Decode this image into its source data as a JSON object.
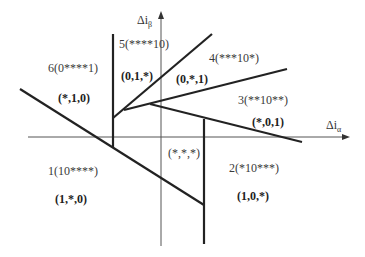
{
  "diagram": {
    "colors": {
      "axis": "#555555",
      "boundary": "#222222",
      "text": "#333333",
      "background": "#ffffff"
    },
    "axes": {
      "x_label": "Δi",
      "x_sub": "α",
      "y_label": "Δi",
      "y_sub": "β"
    },
    "regions": [
      {
        "id": 1,
        "name": "1(10****)",
        "vector": "(1,*,0)"
      },
      {
        "id": 2,
        "name": "2(*10***)",
        "vector": "(1,0,*)"
      },
      {
        "id": 3,
        "name": "3(**10**)",
        "vector": "(*,0,1)"
      },
      {
        "id": 4,
        "name": "4(***10*)",
        "vector": "(0,*,1)"
      },
      {
        "id": 5,
        "name": "5(****10)",
        "vector": "(0,1,*)"
      },
      {
        "id": 6,
        "name": "6(0****1)",
        "vector": "(*,1,0)"
      }
    ],
    "center_label": "(*,*,*)"
  }
}
